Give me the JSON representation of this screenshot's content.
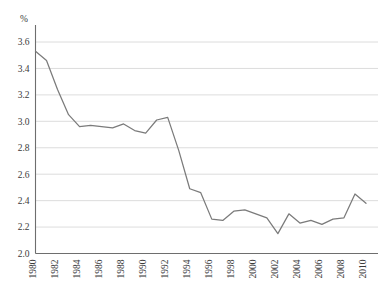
{
  "chart_data": {
    "type": "line",
    "title": "",
    "subtitle": "",
    "xlabel": "",
    "ylabel": "",
    "unit_label": "%",
    "grid": true,
    "legend": false,
    "legend_position": "none",
    "xlim": [
      1980,
      2010
    ],
    "ylim": [
      2.0,
      3.6
    ],
    "ytick_step": 0.2,
    "xtick_step": 2,
    "yticks": [
      "2.0",
      "2.2",
      "2.4",
      "2.6",
      "2.8",
      "3.0",
      "3.2",
      "3.4",
      "3.6"
    ],
    "xticks": [
      "1980",
      "1982",
      "1984",
      "1986",
      "1988",
      "1990",
      "1992",
      "1994",
      "1996",
      "1998",
      "2000",
      "2002",
      "2004",
      "2006",
      "2008",
      "2010"
    ],
    "x": [
      1980,
      1981,
      1982,
      1983,
      1984,
      1985,
      1986,
      1987,
      1988,
      1989,
      1990,
      1991,
      1992,
      1993,
      1994,
      1995,
      1996,
      1997,
      1998,
      1999,
      2000,
      2001,
      2002,
      2003,
      2004,
      2005,
      2006,
      2007,
      2008,
      2009,
      2010
    ],
    "series": [
      {
        "name": "series-1",
        "color": "#7b7b7b",
        "values": [
          3.53,
          3.46,
          3.24,
          3.05,
          2.96,
          2.97,
          2.96,
          2.95,
          2.98,
          2.93,
          2.91,
          3.01,
          3.03,
          2.78,
          2.49,
          2.46,
          2.26,
          2.25,
          2.32,
          2.33,
          2.3,
          2.27,
          2.15,
          2.3,
          2.23,
          2.25,
          2.22,
          2.26,
          2.27,
          2.45,
          2.38
        ]
      }
    ]
  },
  "colors": {
    "line": "#7b7b7b",
    "grid": "#d3d3d3",
    "axis": "#6e6e6e",
    "text": "#3b3b3b",
    "background": "#ffffff"
  }
}
